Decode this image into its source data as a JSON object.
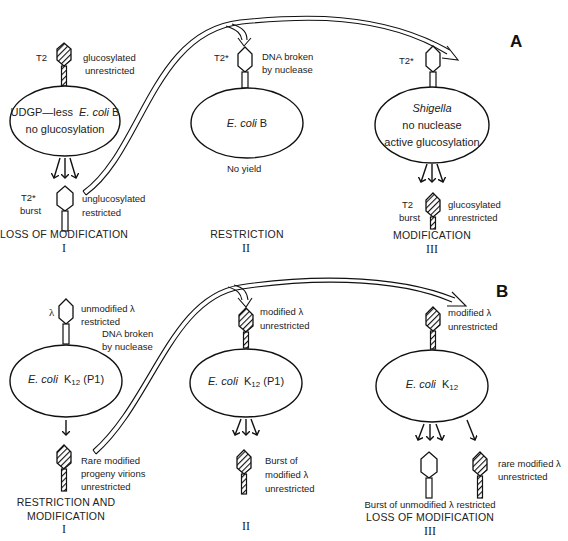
{
  "panels": {
    "A": {
      "label": "A",
      "stage1": {
        "phage_in_name": "T2",
        "phage_in_desc_1": "glucosylated",
        "phage_in_desc_2": "unrestricted",
        "cell_line1_prefix": "UDGP—less",
        "cell_line1_species": "E. coli",
        "cell_line1_strain": "B",
        "cell_line2": "no glucosylation",
        "phage_out_name": "T2*",
        "phage_out_burst": "burst",
        "phage_out_desc_1": "unglucosylated",
        "phage_out_desc_2": "restricted",
        "caption": "LOSS OF MODIFICATION",
        "numeral": "I"
      },
      "stage2": {
        "phage_in_name": "T2*",
        "phage_in_desc_1": "DNA broken",
        "phage_in_desc_2": "by nuclease",
        "cell_species": "E. coli",
        "cell_strain": "B",
        "yield": "No yield",
        "caption": "RESTRICTION",
        "numeral": "II"
      },
      "stage3": {
        "phage_in_name": "T2*",
        "cell_species": "Shigella",
        "cell_line2": "no nuclease",
        "cell_line3": "active glucosylation",
        "phage_out_name": "T2",
        "phage_out_burst": "burst",
        "phage_out_desc_1": "glucosylated",
        "phage_out_desc_2": "unrestricted",
        "caption": "MODIFICATION",
        "numeral": "III"
      }
    },
    "B": {
      "label": "B",
      "stage1": {
        "phage_in_name": "λ",
        "phage_in_desc_1": "unmodified λ",
        "phage_in_desc_2": "restricted",
        "nuclease_1": "DNA broken",
        "nuclease_2": "by nuclease",
        "cell_species": "E. coli",
        "cell_strain": "K",
        "cell_sub": "12",
        "cell_plasmid": "(P1)",
        "phage_out_desc_1": "Rare modified",
        "phage_out_desc_2": "progeny virions",
        "phage_out_desc_3": "unrestricted",
        "caption_1": "RESTRICTION AND",
        "caption_2": "MODIFICATION",
        "numeral": "I"
      },
      "stage2": {
        "phage_in_desc_1": "modified λ",
        "phage_in_desc_2": "unrestricted",
        "cell_species": "E. coli",
        "cell_strain": "K",
        "cell_sub": "12",
        "cell_plasmid": "(P1)",
        "phage_out_desc_1": "Burst of",
        "phage_out_desc_2": "modified λ",
        "phage_out_desc_3": "unrestricted",
        "numeral": "II"
      },
      "stage3": {
        "phage_in_desc_1": "modified λ",
        "phage_in_desc_2": "unrestricted",
        "cell_species": "E. coli",
        "cell_strain": "K",
        "cell_sub": "12",
        "rare_desc_1": "rare modified λ",
        "rare_desc_2": "unrestricted",
        "burst_desc": "Burst of unmodified λ  restricted",
        "caption": "LOSS OF MODIFICATION",
        "numeral": "III"
      }
    }
  },
  "colors": {
    "ink": "#1a1a1a",
    "paper": "#ffffff"
  }
}
